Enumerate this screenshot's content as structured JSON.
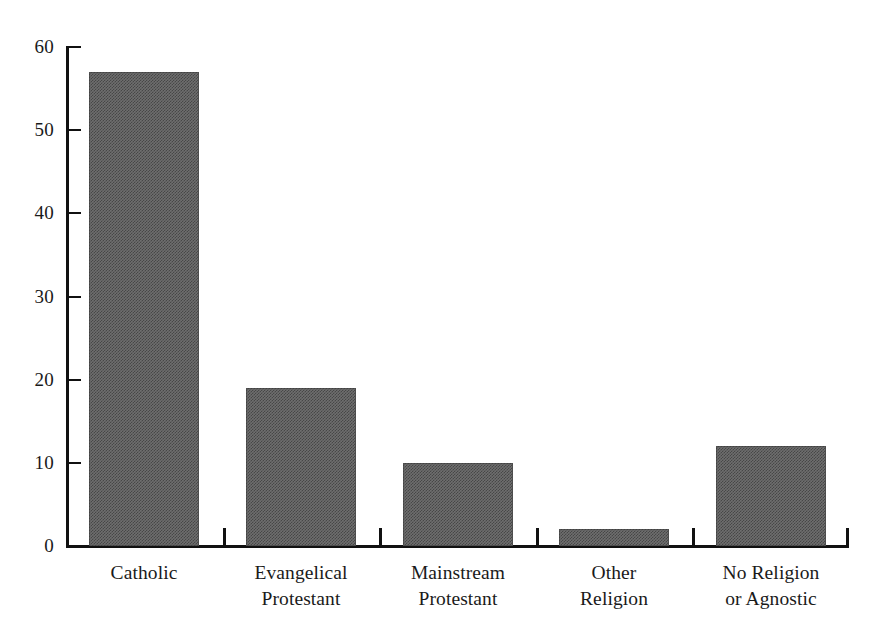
{
  "chart_data": {
    "type": "bar",
    "title": "",
    "subtitle": "",
    "xlabel": "",
    "ylabel": "",
    "categories": [
      "Catholic",
      "Evangelical Protestant",
      "Mainstream Protestant",
      "Other Religion",
      "No Religion or Agnostic"
    ],
    "category_lines": [
      [
        "Catholic",
        ""
      ],
      [
        "Evangelical",
        "Protestant"
      ],
      [
        "Mainstream",
        "Protestant"
      ],
      [
        "Other",
        "Religion"
      ],
      [
        "No Religion",
        "or Agnostic"
      ]
    ],
    "values": [
      57,
      19,
      10,
      2,
      12
    ],
    "ylim": [
      0,
      60
    ],
    "ytick_labels": [
      "0",
      "10",
      "20",
      "30",
      "40",
      "50",
      "60"
    ],
    "ytick_values": [
      0,
      10,
      20,
      30,
      40,
      50,
      60
    ],
    "grid": false,
    "legend": "none",
    "bar_color": "#6e6e6e",
    "axis_color": "#111111",
    "background_color": "#ffffff"
  }
}
